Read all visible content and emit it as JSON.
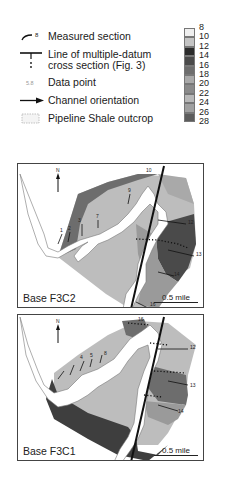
{
  "legend": {
    "items": [
      {
        "icon": "measured-section-icon",
        "label": "Measured section",
        "marker": "8"
      },
      {
        "icon": "cross-section-line-icon",
        "label": "Line of multiple-datum\ncross section (Fig. 3)"
      },
      {
        "icon": "data-point-icon",
        "label": "Data point",
        "marker": "5.8"
      },
      {
        "icon": "channel-arrow-icon",
        "label": "Channel orientation"
      },
      {
        "icon": "outcrop-pattern-icon",
        "label": "Pipeline Shale outcrop"
      }
    ],
    "scale": {
      "ticks": [
        "8",
        "10",
        "12",
        "14",
        "16",
        "18",
        "20",
        "22",
        "24",
        "26",
        "28"
      ],
      "band_colors": [
        "#efefef",
        "#c4c4c4",
        "#2b2b2b",
        "#4a4a4a",
        "#6d6d6d",
        "#a9a9a9",
        "#8a8a8a",
        "#b8b8b8",
        "#a0a0a0",
        "#5c5c5c"
      ]
    }
  },
  "maps": [
    {
      "title": "Base F3C2",
      "scale_label": "0.5 mile",
      "north_label": "N",
      "section_labels": [
        "1",
        "2",
        "3",
        "4",
        "5",
        "6",
        "7",
        "8",
        "9",
        "10",
        "11",
        "12",
        "13",
        "14",
        "15",
        "16"
      ]
    },
    {
      "title": "Base F3C1",
      "scale_label": "0.5 mile",
      "north_label": "N",
      "section_labels": [
        "1",
        "2",
        "3",
        "4",
        "5",
        "6",
        "7",
        "8",
        "9",
        "10",
        "11",
        "12",
        "13",
        "14",
        "15",
        "16"
      ]
    }
  ],
  "colors": {
    "light_fill": "#bdbdbd",
    "mid_fill": "#9a9a9a",
    "dark_fill": "#5a5a5a",
    "darkest_fill": "#3e3e3e",
    "outcrop": "#ffffff",
    "line": "#111111"
  }
}
